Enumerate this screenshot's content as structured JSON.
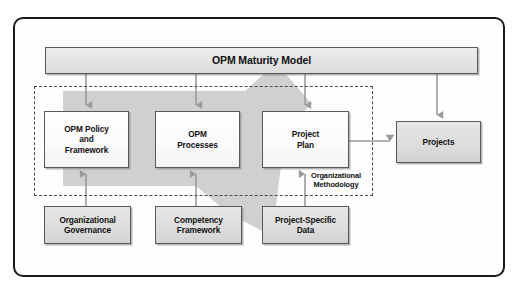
{
  "diagram": {
    "title": "OPM Maturity Model",
    "region_label": "Organizational\nMethodology",
    "region_label_line1": "Organizational",
    "region_label_line2": "Methodology",
    "colors": {
      "frame_border": "#1a1a1a",
      "box_border": "#595959",
      "box_fill_white": "#fbfbfb",
      "box_fill_gray": "#dedede",
      "title_fill": "#e4e4e4",
      "big_arrow": "#cccccc",
      "connector_arrow": "#9a9a9a",
      "dashed_border": "#4a4a4a",
      "text": "#111111"
    },
    "top_bar": {
      "label": "OPM Maturity Model"
    },
    "middle_row": [
      {
        "name": "opm-policy-and-framework",
        "line1": "OPM Policy",
        "line2": "and",
        "line3": "Framework",
        "fill": "white"
      },
      {
        "name": "opm-processes",
        "line1": "OPM",
        "line2": "Processes",
        "line3": "",
        "fill": "white"
      },
      {
        "name": "project-plan",
        "line1": "Project",
        "line2": "Plan",
        "line3": "",
        "fill": "white"
      }
    ],
    "projects_box": {
      "name": "projects",
      "label": "Projects",
      "fill": "gray"
    },
    "bottom_row": [
      {
        "name": "organizational-governance",
        "line1": "Organizational",
        "line2": "Governance",
        "fill": "gray"
      },
      {
        "name": "competency-framework",
        "line1": "Competency",
        "line2": "Framework",
        "fill": "gray"
      },
      {
        "name": "project-specific-data",
        "line1": "Project-Specific",
        "line2": "Data",
        "fill": "gray"
      }
    ],
    "connectors": [
      {
        "name": "title-to-policy",
        "direction": "down"
      },
      {
        "name": "title-to-processes",
        "direction": "down"
      },
      {
        "name": "title-to-plan",
        "direction": "down"
      },
      {
        "name": "title-to-projects",
        "direction": "down"
      },
      {
        "name": "governance-to-policy",
        "direction": "up"
      },
      {
        "name": "competency-to-processes",
        "direction": "up"
      },
      {
        "name": "specific-data-to-plan",
        "direction": "up"
      },
      {
        "name": "plan-to-projects",
        "direction": "right"
      }
    ],
    "background_arrow": {
      "name": "process-flow-arrow",
      "direction": "down-right"
    }
  }
}
